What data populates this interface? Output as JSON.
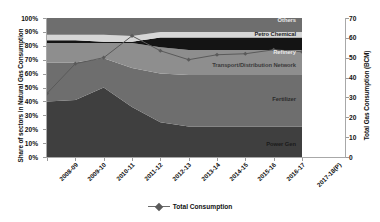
{
  "chart_data": {
    "type": "area",
    "title": "",
    "subtitle": "",
    "xlabel": "",
    "ylabel": "Share of sectors in Natural Gas Consumption",
    "y2label": "Total Gas Consumption (BCM)",
    "categories": [
      "2008-09",
      "2009-10",
      "2010-11",
      "2011-12",
      "2012-13",
      "2013-14",
      "2014-15",
      "2015-16",
      "2016-17",
      "2017-18(P)"
    ],
    "ylim": [
      0,
      100
    ],
    "ytick_labels": [
      "0%",
      "10%",
      "20%",
      "30%",
      "40%",
      "50%",
      "60%",
      "70%",
      "80%",
      "90%",
      "100%"
    ],
    "ytick_values": [
      0,
      10,
      20,
      30,
      40,
      50,
      60,
      70,
      80,
      90,
      100
    ],
    "y2lim": [
      0,
      70
    ],
    "y2tick_labels": [
      "0",
      "10",
      "20",
      "30",
      "40",
      "50",
      "60",
      "70"
    ],
    "y2tick_values": [
      0,
      10,
      20,
      30,
      40,
      50,
      60,
      70
    ],
    "grid": false,
    "legend_position": "bottom",
    "stack_order_bottom_to_top": [
      "Power Gen",
      "Fertilizer",
      "Transport/Distribution Network",
      "Refinery",
      "Petro Chemical",
      "Others"
    ],
    "series": [
      {
        "name": "Power Gen",
        "axis": "left",
        "unit": "%",
        "color": "#3f3f3f",
        "values": [
          40,
          41,
          50,
          36,
          25,
          22,
          22,
          22,
          22,
          22
        ]
      },
      {
        "name": "Fertilizer",
        "axis": "left",
        "unit": "%",
        "color": "#6e6e6e",
        "values": [
          28,
          27,
          21,
          28,
          35,
          37,
          37,
          37,
          37,
          37
        ]
      },
      {
        "name": "Transport/Distribution Network",
        "axis": "left",
        "unit": "%",
        "color": "#8e8e8e",
        "values": [
          14,
          14,
          11,
          18,
          19,
          18,
          18,
          18,
          18,
          18
        ]
      },
      {
        "name": "Refinery",
        "axis": "left",
        "unit": "%",
        "color": "#141414",
        "values": [
          2,
          2,
          1,
          1,
          7,
          9,
          9,
          9,
          9,
          9
        ]
      },
      {
        "name": "Petro Chemical",
        "axis": "left",
        "unit": "%",
        "color": "#d6d6d6",
        "values": [
          4,
          4,
          5,
          4,
          4,
          4,
          4,
          4,
          4,
          4
        ]
      },
      {
        "name": "Others",
        "axis": "left",
        "unit": "%",
        "color": "#6e6e6e",
        "values": [
          12,
          12,
          12,
          13,
          10,
          10,
          10,
          10,
          10,
          10
        ]
      },
      {
        "name": "Total Consumption",
        "axis": "right",
        "unit": "BCM",
        "color": "#5a5a5a",
        "marker": "diamond",
        "values": [
          32.0,
          47.0,
          50.0,
          61.0,
          53.5,
          49.0,
          51.5,
          52.0,
          54.0,
          53.0
        ]
      }
    ]
  },
  "series_labels": [
    {
      "name": "Others",
      "text": "Others"
    },
    {
      "name": "Petro Chemical",
      "text": "Petro Chemical"
    },
    {
      "name": "Refinery",
      "text": "Refinery"
    },
    {
      "name": "Transport/Distribution Network",
      "text": "Transport/Distribution Network"
    },
    {
      "name": "Fertilizer",
      "text": "Fertilizer"
    },
    {
      "name": "Power Gen",
      "text": "Power Gen"
    }
  ],
  "legend": {
    "total_consumption_label": "Total Consumption"
  },
  "colors": {
    "power_gen": "#3f3f3f",
    "fertilizer": "#6e6e6e",
    "transport": "#8e8e8e",
    "refinery": "#141414",
    "petro_chemical": "#d6d6d6",
    "others": "#6e6e6e",
    "total_line": "#5a5a5a",
    "axis": "#a8a8a8"
  }
}
